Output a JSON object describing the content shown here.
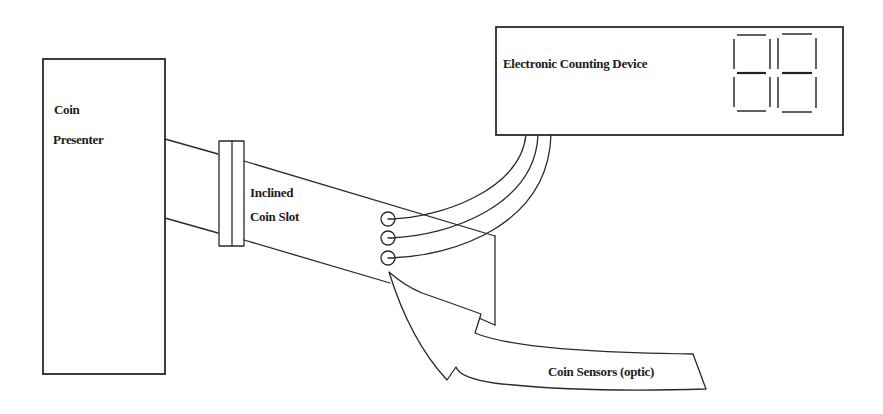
{
  "diagram": {
    "title": "",
    "components": {
      "coin_presenter": {
        "line1": "Coin",
        "line2": "Presenter"
      },
      "inclined_coin_slot": {
        "line1": "Inclined",
        "line2": "Coin Slot"
      },
      "electronic_counting_device": {
        "label": "Electronic Counting Device",
        "display_digits": 2,
        "display_value": "88"
      },
      "coin_sensors": {
        "label": "Coin Sensors (optic)",
        "count": 3
      }
    },
    "connections": [
      {
        "from": "coin_presenter",
        "to": "inclined_coin_slot"
      },
      {
        "from": "coin_sensors",
        "to": "electronic_counting_device",
        "wires": 3
      }
    ],
    "colors": {
      "line": "#2a2a2a",
      "background": "#ffffff",
      "text": "#1c1c1c"
    }
  }
}
